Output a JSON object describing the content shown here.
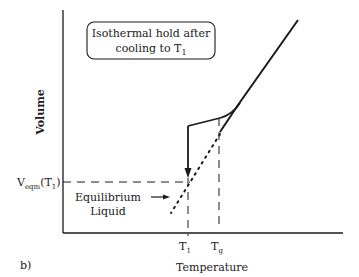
{
  "panel_label": "b)",
  "axes": {
    "ylabel": "Volume",
    "xlabel": "Temperature"
  },
  "annotation_box": {
    "line1": "Isothermal hold after",
    "line2_prefix": "cooling to T",
    "line2_sub": "1"
  },
  "ticks": {
    "t1": {
      "base": "T",
      "sub": "1"
    },
    "tg": {
      "base": "T",
      "sub": "g"
    }
  },
  "y_marker": {
    "base": "V",
    "sub": "eqm",
    "suffix_open": "(T",
    "suffix_sub": "1",
    "suffix_close": ")"
  },
  "equilibrium_label": {
    "line1": "Equilibrium",
    "line2": "Liquid"
  },
  "colors": {
    "ink": "#1a1a1a",
    "background": "#ffffff"
  }
}
